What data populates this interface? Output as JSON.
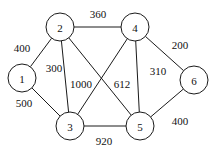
{
  "figure": {
    "background_color": "#ffffff",
    "stroke_color": "#1a1a1a",
    "text_color": "#111111",
    "width": 218,
    "height": 154
  },
  "chart_data": {
    "type": "diagram",
    "title": "",
    "subtitle": "",
    "xlabel": "",
    "ylabel": "",
    "grid": false,
    "legend": "none",
    "graph_kind": "undirected weighted graph",
    "node_radius": 14,
    "nodes": [
      {
        "id": "1",
        "label": "1",
        "cx": 22,
        "cy": 78
      },
      {
        "id": "2",
        "label": "2",
        "cx": 60,
        "cy": 27
      },
      {
        "id": "3",
        "label": "3",
        "cx": 70,
        "cy": 126
      },
      {
        "id": "4",
        "label": "4",
        "cx": 135,
        "cy": 27
      },
      {
        "id": "5",
        "label": "5",
        "cx": 140,
        "cy": 126
      },
      {
        "id": "6",
        "label": "6",
        "cx": 194,
        "cy": 80
      }
    ],
    "edges": [
      {
        "from": "1",
        "to": "2",
        "weight": 400,
        "label": "400",
        "lx": 22,
        "ly": 48
      },
      {
        "from": "1",
        "to": "3",
        "weight": 500,
        "label": "500",
        "lx": 24,
        "ly": 103
      },
      {
        "from": "2",
        "to": "3",
        "weight": 300,
        "label": "300",
        "lx": 54,
        "ly": 68
      },
      {
        "from": "2",
        "to": "4",
        "weight": 360,
        "label": "360",
        "lx": 98,
        "ly": 14
      },
      {
        "from": "2",
        "to": "5",
        "weight": 1000,
        "label": "1000",
        "lx": 81,
        "ly": 84
      },
      {
        "from": "3",
        "to": "4",
        "weight": 612,
        "label": "612",
        "lx": 122,
        "ly": 84
      },
      {
        "from": "3",
        "to": "5",
        "weight": 920,
        "label": "920",
        "lx": 104,
        "ly": 141
      },
      {
        "from": "4",
        "to": "5",
        "weight": 310,
        "label": "310",
        "lx": 158,
        "ly": 71
      },
      {
        "from": "4",
        "to": "6",
        "weight": 200,
        "label": "200",
        "lx": 180,
        "ly": 45
      },
      {
        "from": "5",
        "to": "6",
        "weight": 400,
        "label": "400",
        "lx": 180,
        "ly": 121
      }
    ]
  }
}
